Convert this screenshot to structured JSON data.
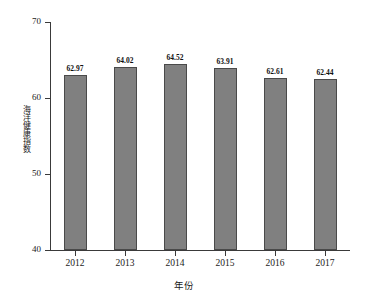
{
  "chart_data": {
    "type": "bar",
    "title": "",
    "xlabel": "年份",
    "ylabel": "海洋健康指数",
    "categories": [
      "2012",
      "2013",
      "2014",
      "2015",
      "2016",
      "2017"
    ],
    "values": [
      62.97,
      64.02,
      64.52,
      63.91,
      62.61,
      62.44
    ],
    "value_labels": [
      "62.97",
      "64.02",
      "64.52",
      "63.91",
      "62.61",
      "62.44"
    ],
    "ylim": [
      40,
      70
    ],
    "yticks": [
      40,
      50,
      60,
      70
    ],
    "ytick_labels": [
      "40",
      "50",
      "60",
      "70"
    ],
    "grid": false,
    "legend": null,
    "bar_color": "#808080",
    "bar_edge_color": "#4a4a4a",
    "background_color": "#ffffff",
    "axis_color": "#3a3a3a",
    "text_color": "#1a1a1a"
  }
}
